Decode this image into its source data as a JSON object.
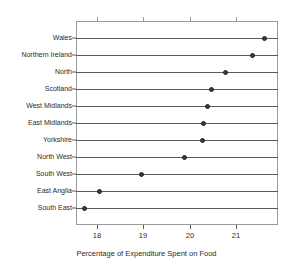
{
  "chart_data": {
    "type": "scatter",
    "subtype": "dot-plot",
    "title": "",
    "xlabel": "Percentage of Expenditure Spent on Food",
    "ylabel": "",
    "xlim": [
      17.55,
      21.9
    ],
    "ylim": [
      0,
      12
    ],
    "grid": false,
    "legend": "none",
    "xticks": [
      18,
      19,
      20,
      21
    ],
    "xticklabels": [
      "18",
      "19",
      "20",
      "21"
    ],
    "categories": [
      "Wales",
      "Northern Ireland",
      "North",
      "Scotland",
      "West Midlands",
      "East Midlands",
      "Yorkshire",
      "North West",
      "South West",
      "East Anglia",
      "South East"
    ],
    "values": [
      21.62,
      21.35,
      20.78,
      20.46,
      20.38,
      20.3,
      20.28,
      19.88,
      18.96,
      18.05,
      17.74
    ],
    "points": [
      {
        "label": "Wales",
        "value": 21.62
      },
      {
        "label": "Northern Ireland",
        "value": 21.35
      },
      {
        "label": "North",
        "value": 20.78
      },
      {
        "label": "Scotland",
        "value": 20.46
      },
      {
        "label": "West Midlands",
        "value": 20.38
      },
      {
        "label": "East Midlands",
        "value": 20.3
      },
      {
        "label": "Yorkshire",
        "value": 20.28
      },
      {
        "label": "North West",
        "value": 19.88
      },
      {
        "label": "South West",
        "value": 18.96
      },
      {
        "label": "East Anglia",
        "value": 18.05
      },
      {
        "label": "South East",
        "value": 17.74
      }
    ],
    "marker_color": "#3a3a3a",
    "line_color": "#5a5a5a",
    "frame_color": "#9a9a9a"
  }
}
